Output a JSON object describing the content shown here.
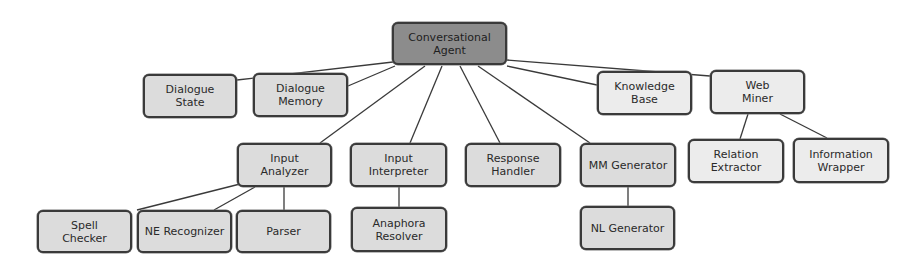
{
  "diagram": {
    "type": "tree",
    "root": "Conversational Agent",
    "colors": {
      "root_fill": "#8c8c8c",
      "node_fill": "#dcdcdc",
      "light_node_fill": "#ececec",
      "border": "#3a3a3a",
      "edge": "#3a3a3a"
    },
    "nodes": [
      {
        "id": "conversational-agent",
        "label": "Conversational\nAgent",
        "style": "root",
        "x": 392,
        "y": 22,
        "w": 115,
        "h": 43
      },
      {
        "id": "dialogue-state",
        "label": "Dialogue\nState",
        "style": "normal",
        "x": 143,
        "y": 74,
        "w": 94,
        "h": 44
      },
      {
        "id": "dialogue-memory",
        "label": "Dialogue\nMemory",
        "style": "normal",
        "x": 253,
        "y": 73,
        "w": 95,
        "h": 44
      },
      {
        "id": "knowledge-base",
        "label": "Knowledge\nBase",
        "style": "light",
        "x": 597,
        "y": 71,
        "w": 95,
        "h": 44
      },
      {
        "id": "web-miner",
        "label": "Web\nMiner",
        "style": "light",
        "x": 710,
        "y": 70,
        "w": 95,
        "h": 44
      },
      {
        "id": "input-analyzer",
        "label": "Input\nAnalyzer",
        "style": "normal",
        "x": 237,
        "y": 143,
        "w": 95,
        "h": 44
      },
      {
        "id": "input-interpreter",
        "label": "Input\nInterpreter",
        "style": "normal",
        "x": 350,
        "y": 143,
        "w": 97,
        "h": 44
      },
      {
        "id": "response-handler",
        "label": "Response\nHandler",
        "style": "normal",
        "x": 465,
        "y": 143,
        "w": 96,
        "h": 44
      },
      {
        "id": "mm-generator",
        "label": "MM Generator",
        "style": "normal",
        "x": 580,
        "y": 143,
        "w": 96,
        "h": 44
      },
      {
        "id": "relation-extractor",
        "label": "Relation\nExtractor",
        "style": "light",
        "x": 688,
        "y": 139,
        "w": 96,
        "h": 44
      },
      {
        "id": "information-wrapper",
        "label": "Information\nWrapper",
        "style": "light",
        "x": 793,
        "y": 138,
        "w": 96,
        "h": 45
      },
      {
        "id": "spell-checker",
        "label": "Spell\nChecker",
        "style": "normal",
        "x": 37,
        "y": 210,
        "w": 95,
        "h": 43
      },
      {
        "id": "ne-recognizer",
        "label": "NE Recognizer",
        "style": "normal",
        "x": 137,
        "y": 210,
        "w": 95,
        "h": 43
      },
      {
        "id": "parser",
        "label": "Parser",
        "style": "normal",
        "x": 236,
        "y": 210,
        "w": 95,
        "h": 43
      },
      {
        "id": "anaphora-resolver",
        "label": "Anaphora\nResolver",
        "style": "normal",
        "x": 351,
        "y": 207,
        "w": 96,
        "h": 45
      },
      {
        "id": "nl-generator",
        "label": "NL Generator",
        "style": "normal",
        "x": 580,
        "y": 206,
        "w": 95,
        "h": 44
      }
    ],
    "edges": [
      {
        "from": "conversational-agent",
        "to": "dialogue-state",
        "x1": 393,
        "y1": 62,
        "x2": 237,
        "y2": 80
      },
      {
        "from": "conversational-agent",
        "to": "dialogue-memory",
        "x1": 395,
        "y1": 66,
        "x2": 348,
        "y2": 86
      },
      {
        "from": "conversational-agent",
        "to": "input-analyzer",
        "x1": 425,
        "y1": 66,
        "x2": 320,
        "y2": 143
      },
      {
        "from": "conversational-agent",
        "to": "input-interpreter",
        "x1": 442,
        "y1": 66,
        "x2": 410,
        "y2": 143
      },
      {
        "from": "conversational-agent",
        "to": "response-handler",
        "x1": 460,
        "y1": 66,
        "x2": 500,
        "y2": 143
      },
      {
        "from": "conversational-agent",
        "to": "mm-generator",
        "x1": 478,
        "y1": 66,
        "x2": 590,
        "y2": 143
      },
      {
        "from": "conversational-agent",
        "to": "knowledge-base",
        "x1": 507,
        "y1": 66,
        "x2": 597,
        "y2": 85
      },
      {
        "from": "conversational-agent",
        "to": "web-miner",
        "x1": 507,
        "y1": 60,
        "x2": 710,
        "y2": 76
      },
      {
        "from": "web-miner",
        "to": "relation-extractor",
        "x1": 748,
        "y1": 114,
        "x2": 740,
        "y2": 139
      },
      {
        "from": "web-miner",
        "to": "information-wrapper",
        "x1": 780,
        "y1": 114,
        "x2": 827,
        "y2": 138
      },
      {
        "from": "input-analyzer",
        "to": "spell-checker",
        "x1": 240,
        "y1": 184,
        "x2": 137,
        "y2": 210
      },
      {
        "from": "input-analyzer",
        "to": "ne-recognizer",
        "x1": 255,
        "y1": 187,
        "x2": 214,
        "y2": 210
      },
      {
        "from": "input-analyzer",
        "to": "parser",
        "x1": 284,
        "y1": 187,
        "x2": 284,
        "y2": 210
      },
      {
        "from": "input-interpreter",
        "to": "anaphora-resolver",
        "x1": 399,
        "y1": 187,
        "x2": 399,
        "y2": 207
      },
      {
        "from": "mm-generator",
        "to": "nl-generator",
        "x1": 628,
        "y1": 187,
        "x2": 628,
        "y2": 206
      }
    ]
  }
}
